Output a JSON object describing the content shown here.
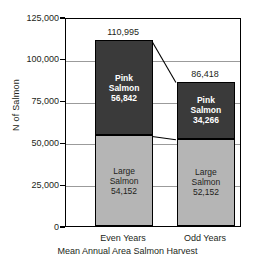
{
  "chart_data": {
    "type": "bar",
    "subtype": "stacked-bar",
    "title": "",
    "xlabel": "Mean Annual Area Salmon Harvest",
    "ylabel": "N of Salmon",
    "categories": [
      "Even Years",
      "Odd Years"
    ],
    "series": [
      {
        "name": "Large Salmon",
        "values": [
          54152,
          52152
        ],
        "color": "#b5b5b5",
        "stack_position": "bottom"
      },
      {
        "name": "Pink Salmon",
        "values": [
          56842,
          34266
        ],
        "color": "#3a3a3a",
        "stack_position": "top"
      }
    ],
    "totals": [
      110995,
      86418
    ],
    "ylim": [
      0,
      125000
    ],
    "yticks": [
      0,
      25000,
      50000,
      75000,
      100000,
      125000
    ],
    "ytick_labels": [
      "0",
      "25,000",
      "50,000",
      "75,000",
      "100,000",
      "125,000"
    ],
    "grid": true,
    "legend": "none",
    "annotations": [
      "connector line between bar tops",
      "connector line between stack boundaries"
    ]
  },
  "axis": {
    "y_title": "N of Salmon",
    "x_title": "Mean Annual Area Salmon Harvest",
    "y_ticks": [
      {
        "label": "125,000",
        "value": 125000
      },
      {
        "label": "100,000",
        "value": 100000
      },
      {
        "label": "75,000",
        "value": 75000
      },
      {
        "label": "50,000",
        "value": 50000
      },
      {
        "label": "25,000",
        "value": 25000
      },
      {
        "label": "0",
        "value": 0
      }
    ]
  },
  "bars": [
    {
      "category": "Even Years",
      "total_label": "110,995",
      "segments": [
        {
          "name_line1": "Pink",
          "name_line2": "Salmon",
          "value_label": "56,842",
          "value": 56842
        },
        {
          "name_line1": "Large",
          "name_line2": "Salmon",
          "value_label": "54,152",
          "value": 54152
        }
      ]
    },
    {
      "category": "Odd Years",
      "total_label": "86,418",
      "segments": [
        {
          "name_line1": "Pink",
          "name_line2": "Salmon",
          "value_label": "34,266",
          "value": 34266
        },
        {
          "name_line1": "Large",
          "name_line2": "Salmon",
          "value_label": "52,152",
          "value": 52152
        }
      ]
    }
  ],
  "colors": {
    "pink_salmon": "#3a3a3a",
    "large_salmon": "#b5b5b5",
    "axis": "#000000",
    "gridline": "#9b9b9b",
    "text": "#231f20"
  }
}
